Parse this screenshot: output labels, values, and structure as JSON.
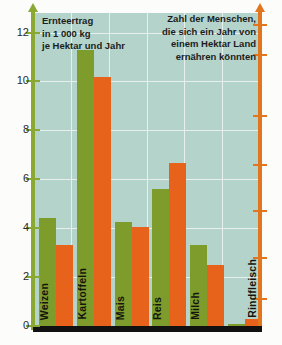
{
  "chart_data": {
    "type": "bar",
    "title": "",
    "title_left": "Ernteertrag\nin 1 000 kg\nje Hektar und Jahr",
    "title_right": "Zahl der Menschen,\ndie sich ein Jahr von\neinem Hektar Land\nernähren könnten",
    "categories": [
      "Weizen",
      "Kartoffeln",
      "Mais",
      "Reis",
      "Milch",
      "Rindfleisch"
    ],
    "series": [
      {
        "name": "Ernteertrag in 1 000 kg je Hektar und Jahr",
        "color": "#7d9c2c",
        "axis": "left",
        "values": [
          4.4,
          11.3,
          4.25,
          5.6,
          3.3,
          0.1
        ]
      },
      {
        "name": "Zahl der Menschen, die sich ein Jahr von einem Hektar Land ernähren könnten",
        "color": "#e7631b",
        "axis": "right",
        "values": [
          3.3,
          10.2,
          4.05,
          6.65,
          2.5,
          0.3
        ]
      }
    ],
    "xlabel": "",
    "ylabel": "",
    "ylim": [
      0,
      12.8
    ],
    "yticks": [
      0,
      2,
      4,
      6,
      8,
      10,
      12
    ],
    "ytick_labels": [
      "0",
      "2",
      "4",
      "6",
      "8",
      "10",
      "12"
    ],
    "right_axis_ticks_visible": true,
    "right_axis_tick_labels": [],
    "grid": true,
    "legend_position": "none",
    "plot_background": "#b3d3cb",
    "gridline_color": "#e8f0ee",
    "left_axis_color": "#8aa832",
    "right_axis_color": "#e2761f",
    "baseline_color": "#111111"
  }
}
